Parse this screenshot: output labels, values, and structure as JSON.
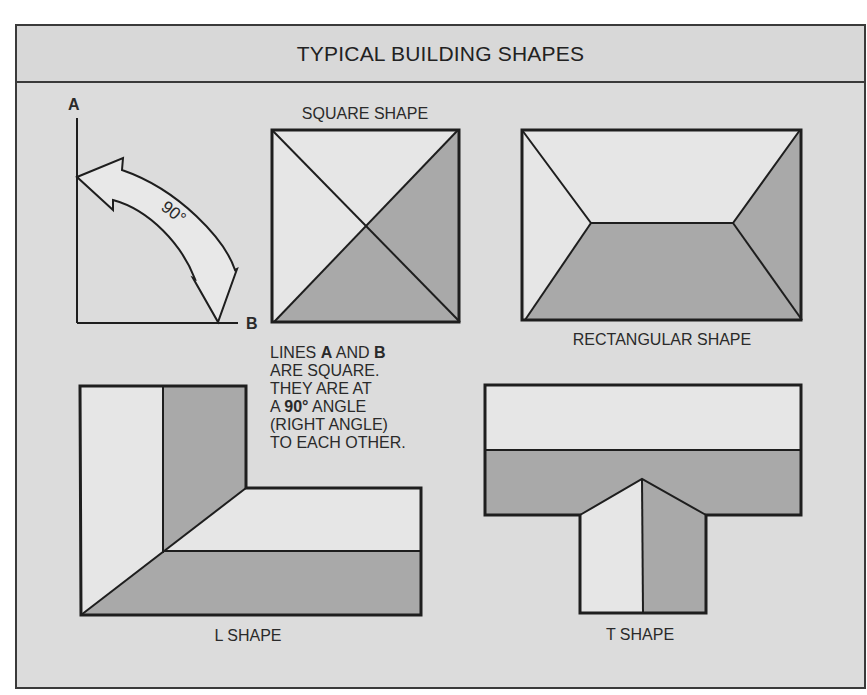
{
  "title": "TYPICAL BUILDING SHAPES",
  "angle_diagram": {
    "line_a_label": "A",
    "line_b_label": "B",
    "angle_label": "90°"
  },
  "note": {
    "lines": [
      [
        "LINES ",
        "A",
        " AND ",
        "B"
      ],
      [
        "ARE SQUARE."
      ],
      [
        "THEY ARE AT"
      ],
      [
        "A ",
        "90°",
        " ANGLE"
      ],
      [
        "(RIGHT ANGLE)"
      ],
      [
        "TO EACH OTHER."
      ]
    ],
    "line1_pre": "LINES ",
    "line1_a": "A",
    "line1_mid": " AND ",
    "line1_b": "B",
    "line2": "ARE SQUARE.",
    "line3": "THEY ARE AT",
    "line4_pre": "A ",
    "line4_bold": "90°",
    "line4_post": " ANGLE",
    "line5": "(RIGHT ANGLE)",
    "line6": "TO EACH OTHER."
  },
  "shapes": {
    "square": {
      "label": "SQUARE SHAPE"
    },
    "rectangular": {
      "label": "RECTANGULAR SHAPE"
    },
    "l": {
      "label": "L SHAPE"
    },
    "t": {
      "label": "T SHAPE"
    }
  },
  "colors": {
    "background": "#dcdcdc",
    "light_face": "#e6e6e6",
    "dark_face": "#a9a9a9",
    "line": "#1e1e1e"
  }
}
